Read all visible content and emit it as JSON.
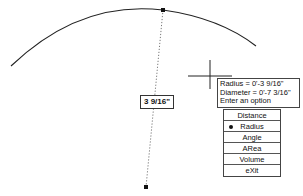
{
  "drawing": {
    "arc": {
      "color": "#222222"
    },
    "dimension_value": "3 9/16\"",
    "center_point": {
      "x": 146,
      "y": 187
    },
    "arc_point": {
      "x": 163,
      "y": 10
    }
  },
  "tooltip": {
    "lines": [
      "Radius = 0'-3 9/16\"",
      "Diameter = 0'-7 3/16\"",
      "Enter an option"
    ]
  },
  "options_menu": {
    "items": [
      {
        "label": "Distance",
        "selected": false
      },
      {
        "label": "Radius",
        "selected": true
      },
      {
        "label": "Angle",
        "selected": false
      },
      {
        "label": "ARea",
        "selected": false
      },
      {
        "label": "Volume",
        "selected": false
      },
      {
        "label": "eXit",
        "selected": false
      }
    ]
  }
}
